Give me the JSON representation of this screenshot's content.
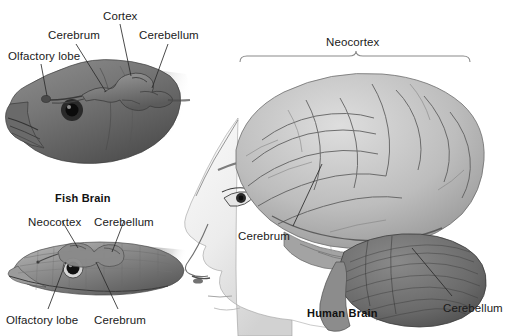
{
  "figure": {
    "background": "#ffffff",
    "ink": "#1a1a1a"
  },
  "panels": [
    {
      "id": "fish",
      "caption": "Fish Brain",
      "organism_icon": "fish-head-icon",
      "labels": [
        {
          "name": "olfactory-lobe",
          "text": "Olfactory lobe",
          "x": 8,
          "y": 50
        },
        {
          "name": "cerebrum",
          "text": "Cerebrum",
          "x": 48,
          "y": 29
        },
        {
          "name": "cortex",
          "text": "Cortex",
          "x": 103,
          "y": 10
        },
        {
          "name": "cerebellum",
          "text": "Cerebellum",
          "x": 139,
          "y": 29
        }
      ]
    },
    {
      "id": "reptile",
      "caption": "",
      "organism_icon": "lizard-head-icon",
      "labels": [
        {
          "name": "neocortex",
          "text": "Neocortex",
          "x": 28,
          "y": 216
        },
        {
          "name": "cerebellum",
          "text": "Cerebellum",
          "x": 94,
          "y": 216
        },
        {
          "name": "olfactory-lobe",
          "text": "Olfactory lobe",
          "x": 6,
          "y": 314
        },
        {
          "name": "cerebrum",
          "text": "Cerebrum",
          "x": 94,
          "y": 314
        }
      ]
    },
    {
      "id": "human",
      "caption": "Human Brain",
      "organism_icon": "human-head-profile-icon",
      "labels": [
        {
          "name": "neocortex",
          "text": "Neocortex",
          "x": 326,
          "y": 38
        },
        {
          "name": "cerebrum",
          "text": "Cerebrum",
          "x": 238,
          "y": 231
        },
        {
          "name": "cerebellum",
          "text": "Cerebellum",
          "x": 443,
          "y": 303
        }
      ]
    }
  ],
  "captions": {
    "fish": "Fish Brain",
    "human": "Human Brain"
  },
  "brace": {
    "name": "neocortex-span-brace",
    "left_x": 240,
    "right_x": 470,
    "y": 58
  },
  "colors": {
    "ink": "#1a1a1a",
    "leader_line": "#2b2b2b",
    "tissue_light": "#d8d8d8",
    "tissue_mid": "#a8a8a8",
    "tissue_dark": "#6e6e6e",
    "cerebellum_dark": "#5a5a5a",
    "skin_light": "#efefef"
  }
}
